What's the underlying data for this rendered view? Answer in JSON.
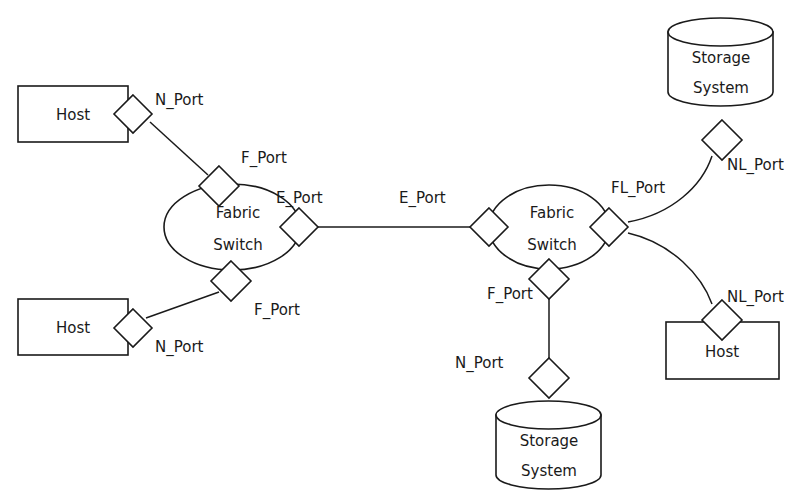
{
  "diagram": {
    "background_color": "#ffffff",
    "stroke_color": "#1a1a1a",
    "fill_color": "#ffffff",
    "nodes": [
      {
        "id": "host-top-left",
        "shape": "rectangle",
        "label": "Host",
        "x": 18,
        "y": 86,
        "width": 110,
        "height": 56
      },
      {
        "id": "host-bottom-left",
        "shape": "rectangle",
        "label": "Host",
        "x": 18,
        "y": 299,
        "width": 110,
        "height": 56
      },
      {
        "id": "fabric-switch-left",
        "shape": "ellipse",
        "label_line1": "Fabric",
        "label_line2": "Switch",
        "cx": 232,
        "cy": 227,
        "rx": 68,
        "ry": 43
      },
      {
        "id": "fabric-switch-right",
        "shape": "ellipse",
        "label_line1": "Fabric",
        "label_line2": "Switch",
        "cx": 549,
        "cy": 227,
        "rx": 60,
        "ry": 42
      },
      {
        "id": "storage-system-top-right",
        "shape": "cylinder",
        "label_line1": "Storage",
        "label_line2": "System",
        "x": 668,
        "y": 18,
        "width": 105,
        "height": 88
      },
      {
        "id": "storage-system-bottom-center",
        "shape": "cylinder",
        "label_line1": "Storage",
        "label_line2": "System",
        "x": 496,
        "y": 401,
        "width": 105,
        "height": 88
      },
      {
        "id": "host-bottom-right",
        "shape": "rectangle",
        "label": "Host",
        "x": 666,
        "y": 322,
        "width": 113,
        "height": 57
      }
    ],
    "ports": [
      {
        "id": "n-port-top-left-host",
        "label": "N_Port",
        "cx": 133,
        "cy": 114,
        "r": 19,
        "label_x": 155,
        "label_y": 100
      },
      {
        "id": "f-port-left-switch-top",
        "label": "F_Port",
        "cx": 219,
        "cy": 186,
        "r": 20,
        "label_x": 241,
        "label_y": 158
      },
      {
        "id": "e-port-left-switch",
        "label": "E_Port",
        "cx": 299,
        "cy": 227,
        "r": 19,
        "label_x": 276,
        "label_y": 198
      },
      {
        "id": "f-port-left-switch-bottom",
        "label": "F_Port",
        "cx": 231,
        "cy": 281,
        "r": 20,
        "label_x": 254,
        "label_y": 310
      },
      {
        "id": "n-port-bottom-left-host",
        "label": "N_Port",
        "cx": 133,
        "cy": 328,
        "r": 19,
        "label_x": 155,
        "label_y": 347
      },
      {
        "id": "e-port-right-switch",
        "label": "E_Port",
        "cx": 489,
        "cy": 227,
        "r": 19,
        "label_x": 399,
        "label_y": 198
      },
      {
        "id": "fl-port-right-switch",
        "label": "FL_Port",
        "cx": 609,
        "cy": 227,
        "r": 19,
        "label_x": 611,
        "label_y": 188
      },
      {
        "id": "f-port-right-switch-bottom",
        "label": "F_Port",
        "cx": 549,
        "cy": 279,
        "r": 20,
        "label_x": 487,
        "label_y": 294
      },
      {
        "id": "n-port-bottom-storage",
        "label": "N_Port",
        "cx": 549,
        "cy": 378,
        "r": 20,
        "label_x": 455,
        "label_y": 363
      },
      {
        "id": "nl-port-top-storage",
        "label": "NL_Port",
        "cx": 722,
        "cy": 140,
        "r": 20,
        "label_x": 727,
        "label_y": 165
      },
      {
        "id": "nl-port-bottom-right-host",
        "label": "NL_Port",
        "cx": 722,
        "cy": 320,
        "r": 20,
        "label_x": 727,
        "label_y": 297
      }
    ],
    "links": [
      {
        "id": "link-host-tl-to-f-port",
        "from": "n-port-top-left-host",
        "to": "f-port-left-switch-top",
        "path": "M 150 122 L 208 175"
      },
      {
        "id": "link-e-port-to-e-port",
        "from": "e-port-left-switch",
        "to": "e-port-right-switch",
        "path": "M 318 227 L 470 227"
      },
      {
        "id": "link-host-bl-to-f-port",
        "from": "n-port-bottom-left-host",
        "to": "f-port-left-switch-bottom",
        "path": "M 146 318 L 219 292"
      },
      {
        "id": "link-f-port-to-n-port-storage",
        "from": "f-port-right-switch-bottom",
        "to": "n-port-bottom-storage",
        "path": "M 549 299 L 549 358"
      },
      {
        "id": "link-fl-port-to-nl-port-storage",
        "from": "fl-port-right-switch",
        "to": "nl-port-top-storage",
        "path": "M 628 222 C 672 214 702 186 712 156"
      },
      {
        "id": "link-fl-port-to-nl-port-host",
        "from": "fl-port-right-switch",
        "to": "nl-port-bottom-right-host",
        "path": "M 628 233 C 672 243 702 276 712 304"
      }
    ]
  }
}
